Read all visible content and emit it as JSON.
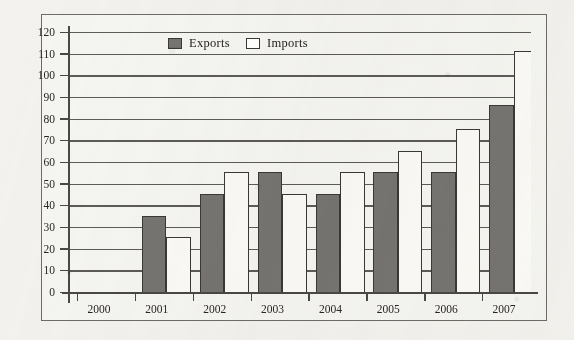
{
  "chart_data": {
    "type": "bar",
    "title": "",
    "xlabel": "",
    "ylabel": "",
    "ylim": [
      0,
      120
    ],
    "ytick_step": 10,
    "grid": true,
    "legend_position": "inside-top-center",
    "categories": [
      "2000",
      "2001",
      "2002",
      "2003",
      "2004",
      "2005",
      "2006",
      "2007"
    ],
    "yticks": [
      "120",
      "110",
      "100",
      "90",
      "80",
      "70",
      "60",
      "50",
      "40",
      "30",
      "20",
      "10",
      "0"
    ],
    "series": [
      {
        "name": "Exports",
        "color": "#767471",
        "values": [
          50,
          60,
          70,
          60,
          70,
          70,
          101,
          111
        ]
      },
      {
        "name": "Imports",
        "color": "#fbfaf7",
        "values": [
          40,
          70,
          60,
          70,
          80,
          90,
          126,
          126
        ],
        "notes": "2006 and 2007 bars are clipped by the top of the plot area (exceed 120)"
      }
    ]
  },
  "legend": {
    "items": [
      {
        "label": "Exports",
        "swatch": "exports-swatch"
      },
      {
        "label": "Imports",
        "swatch": "imports-swatch"
      }
    ]
  }
}
